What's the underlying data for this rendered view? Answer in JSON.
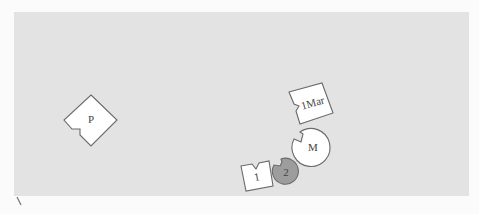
{
  "diagram": {
    "background_color": "#e3e3e3",
    "page_color": "#fbfbfb",
    "stroke_color": "#6a6a6a",
    "nodes": [
      {
        "id": "P",
        "label": "P",
        "shape": "notched-diamond",
        "fill": "#ffffff"
      },
      {
        "id": "1Mar",
        "label": "1Mar",
        "shape": "notched-square",
        "fill": "#ffffff"
      },
      {
        "id": "M",
        "label": "M",
        "shape": "notched-circle",
        "fill": "#ffffff"
      },
      {
        "id": "1",
        "label": "1",
        "shape": "notched-square",
        "fill": "#ffffff"
      },
      {
        "id": "2",
        "label": "2",
        "shape": "notched-circle",
        "fill": "#9d9d9d"
      }
    ]
  }
}
